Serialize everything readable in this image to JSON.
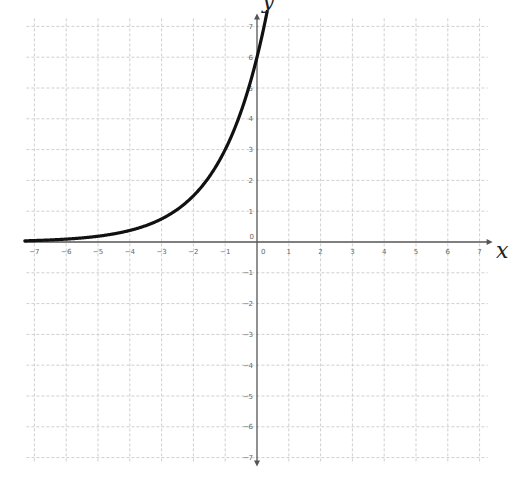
{
  "chart_data": {
    "type": "line",
    "title": "",
    "xlabel": "x",
    "ylabel": "y",
    "xlim": [
      -7,
      7
    ],
    "ylim": [
      -7,
      7
    ],
    "grid": true,
    "x_ticks": [
      -7,
      -6,
      -5,
      -4,
      -3,
      -2,
      -1,
      0,
      1,
      2,
      3,
      4,
      5,
      6,
      7
    ],
    "y_ticks": [
      -7,
      -6,
      -5,
      -4,
      -3,
      -2,
      -1,
      0,
      1,
      2,
      3,
      4,
      5,
      6,
      7
    ],
    "series": [
      {
        "name": "y = 6·2^x",
        "function": "6*2^x",
        "x": [
          -7,
          -6,
          -5,
          -4,
          -3,
          -2,
          -1,
          0,
          0.2
        ],
        "y": [
          0.05,
          0.09,
          0.19,
          0.38,
          0.75,
          1.5,
          3,
          6,
          6.9
        ]
      }
    ],
    "colors": {
      "curve": "#111111",
      "grid": "#cfcfcf",
      "axis": "#555555",
      "tick_text": "#666666"
    }
  },
  "labels": {
    "x_axis": "x",
    "y_axis": "y"
  }
}
